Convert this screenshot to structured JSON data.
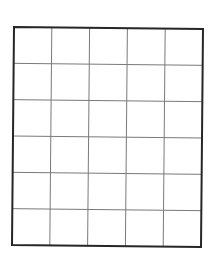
{
  "diagram": {
    "type": "empty-grid",
    "rows": 6,
    "columns": 5,
    "colors": {
      "background": "#ffffff",
      "border": "#262626",
      "gridlines": "#7a7a7a"
    },
    "corners": {
      "top_left": [
        14,
        27
      ],
      "top_right": [
        203,
        29
      ],
      "bottom_right": [
        201,
        247
      ],
      "bottom_left": [
        12,
        245
      ]
    }
  }
}
